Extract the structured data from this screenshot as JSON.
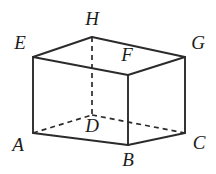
{
  "figure": {
    "type": "geometry-diagram",
    "shape": "cuboid",
    "canvas": {
      "width": 216,
      "height": 174,
      "background": "#ffffff"
    },
    "style": {
      "solid_edge_color": "#2b2b2b",
      "hidden_edge_color": "#2b2b2b",
      "label_color": "#1c1c1c",
      "solid_stroke_width": 1.9,
      "hidden_stroke_width": 1.7,
      "hidden_dash_pattern": "5 4",
      "label_font_size": 19,
      "label_font_style": "italic"
    },
    "vertices": [
      {
        "id": "A",
        "label": "A",
        "x": 33,
        "y": 133,
        "label_x": 18,
        "label_y": 147,
        "hidden": false
      },
      {
        "id": "B",
        "label": "B",
        "x": 128,
        "y": 145,
        "label_x": 128,
        "label_y": 162,
        "hidden": false
      },
      {
        "id": "C",
        "label": "C",
        "x": 185,
        "y": 133,
        "label_x": 199,
        "label_y": 145,
        "hidden": false
      },
      {
        "id": "D",
        "label": "D",
        "x": 92,
        "y": 115,
        "label_x": 92,
        "label_y": 128,
        "hidden": true
      },
      {
        "id": "E",
        "label": "E",
        "x": 33,
        "y": 57,
        "label_x": 20,
        "label_y": 45,
        "hidden": false
      },
      {
        "id": "F",
        "label": "F",
        "x": 128,
        "y": 75,
        "label_x": 127,
        "label_y": 57,
        "hidden": false
      },
      {
        "id": "G",
        "label": "G",
        "x": 185,
        "y": 57,
        "label_x": 198,
        "label_y": 45,
        "hidden": false
      },
      {
        "id": "H",
        "label": "H",
        "x": 92,
        "y": 37,
        "label_x": 92,
        "label_y": 21,
        "hidden": false
      }
    ],
    "edges_solid": [
      {
        "id": "edge-EH",
        "from": "E",
        "to": "H",
        "x1": 33,
        "y1": 57,
        "x2": 92,
        "y2": 37
      },
      {
        "id": "edge-HG",
        "from": "H",
        "to": "G",
        "x1": 92,
        "y1": 37,
        "x2": 185,
        "y2": 57
      },
      {
        "id": "edge-EF",
        "from": "E",
        "to": "F",
        "x1": 33,
        "y1": 57,
        "x2": 128,
        "y2": 75
      },
      {
        "id": "edge-FG",
        "from": "F",
        "to": "G",
        "x1": 128,
        "y1": 75,
        "x2": 185,
        "y2": 57
      },
      {
        "id": "edge-EA",
        "from": "E",
        "to": "A",
        "x1": 33,
        "y1": 57,
        "x2": 33,
        "y2": 133
      },
      {
        "id": "edge-FB",
        "from": "F",
        "to": "B",
        "x1": 128,
        "y1": 75,
        "x2": 128,
        "y2": 145
      },
      {
        "id": "edge-GC",
        "from": "G",
        "to": "C",
        "x1": 185,
        "y1": 57,
        "x2": 185,
        "y2": 133
      },
      {
        "id": "edge-AB",
        "from": "A",
        "to": "B",
        "x1": 33,
        "y1": 133,
        "x2": 128,
        "y2": 145
      },
      {
        "id": "edge-BC",
        "from": "B",
        "to": "C",
        "x1": 128,
        "y1": 145,
        "x2": 185,
        "y2": 133
      }
    ],
    "edges_hidden": [
      {
        "id": "edge-HD",
        "from": "H",
        "to": "D",
        "x1": 92,
        "y1": 37,
        "x2": 92,
        "y2": 115
      },
      {
        "id": "edge-AD",
        "from": "A",
        "to": "D",
        "x1": 33,
        "y1": 133,
        "x2": 92,
        "y2": 115
      },
      {
        "id": "edge-DC",
        "from": "D",
        "to": "C",
        "x1": 92,
        "y1": 115,
        "x2": 185,
        "y2": 133
      }
    ]
  }
}
